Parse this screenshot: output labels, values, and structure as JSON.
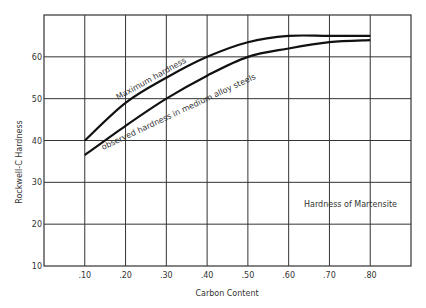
{
  "chart_data": {
    "type": "line",
    "title": "",
    "xlabel": "Carbon Content",
    "ylabel": "Rockwell-C Hardness",
    "x_ticks": [
      ".10",
      ".20",
      ".30",
      ".40",
      ".50",
      ".60",
      ".70",
      ".80"
    ],
    "y_ticks": [
      "10",
      "20",
      "30",
      "40",
      "50",
      "60"
    ],
    "xlim": [
      0.0,
      0.9
    ],
    "ylim": [
      10,
      70
    ],
    "grid": true,
    "x": [
      0.1,
      0.2,
      0.3,
      0.4,
      0.5,
      0.6,
      0.7,
      0.8
    ],
    "series": [
      {
        "name": "Maximum hardness",
        "values": [
          40,
          49,
          55,
          60,
          63.5,
          65,
          65,
          65
        ]
      },
      {
        "name": "observed hardness in medium alloy steels",
        "values": [
          36.5,
          43.5,
          50,
          55.5,
          60,
          62,
          63.5,
          64
        ]
      }
    ],
    "annotations": [
      "Hardness of Martensite"
    ]
  },
  "labels": {
    "xlabel": "Carbon Content",
    "ylabel": "Rockwell-C Hardness",
    "series1": "Maximum hardness",
    "series2": "observed hardness in medium alloy steels",
    "annotation": "Hardness of Martensite"
  }
}
